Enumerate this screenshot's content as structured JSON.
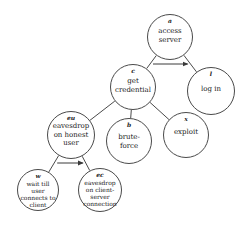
{
  "diagram": {
    "type": "attack-tree",
    "nodes": [
      {
        "key": "a",
        "id": "a",
        "label": "access\nserver",
        "cx": 170,
        "cy": 37,
        "r": 23
      },
      {
        "key": "c",
        "id": "c",
        "label": "get\ncredential",
        "cx": 133,
        "cy": 87,
        "r": 23
      },
      {
        "key": "l",
        "id": "l",
        "label": "log in",
        "cx": 211,
        "cy": 91,
        "r": 24
      },
      {
        "key": "eu",
        "id": "eu",
        "label": "eavesdrop\non honest\nuser",
        "cx": 71,
        "cy": 135,
        "r": 24
      },
      {
        "key": "b",
        "id": "b",
        "label": "brute-\nforce",
        "cx": 129,
        "cy": 141,
        "r": 23
      },
      {
        "key": "x",
        "id": "x",
        "label": "exploit",
        "cx": 186,
        "cy": 135,
        "r": 23
      },
      {
        "key": "w",
        "id": "w",
        "label": "wait till\nuser\nconnects to\nclient",
        "cx": 38,
        "cy": 190,
        "r": 21
      },
      {
        "key": "ec",
        "id": "ec",
        "label": "eavesdrop\non client-\nserver\nconnection",
        "cx": 100,
        "cy": 190,
        "r": 22
      }
    ],
    "edges": [
      {
        "from": "a",
        "to": "c"
      },
      {
        "from": "a",
        "to": "l"
      },
      {
        "from": "c",
        "to": "eu"
      },
      {
        "from": "c",
        "to": "b"
      },
      {
        "from": "c",
        "to": "x"
      },
      {
        "from": "eu",
        "to": "w"
      },
      {
        "from": "eu",
        "to": "ec"
      }
    ],
    "sequence_arrows": [
      {
        "under": "a",
        "from": "c",
        "to": "l",
        "meaning": "sequential (AND) ordering"
      },
      {
        "under": "eu",
        "from": "w",
        "to": "ec",
        "meaning": "sequential (AND) ordering"
      }
    ],
    "colors": {
      "stroke": "#4a4a4a",
      "text": "#1a1a1a",
      "background": "#ffffff"
    }
  }
}
